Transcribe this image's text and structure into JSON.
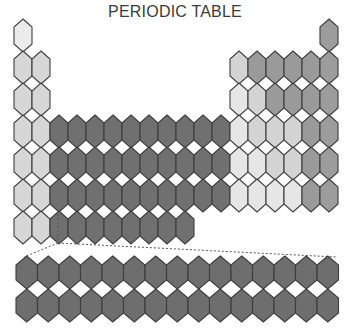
{
  "title": "PERIODIC TABLE",
  "colors": {
    "s_light": "#d6d6d6",
    "h_light": "#ebebeb",
    "transition": "#707070",
    "f_block": "#6e6e6e",
    "p_lightest": "#e6e6e6",
    "p_light": "#d3d3d3",
    "p_mid": "#b3b3b3",
    "p_dark": "#9a9a9a",
    "noble": "#9c9c9c",
    "stroke": "#3d3d3d"
  },
  "grid": {
    "origin_x": 14,
    "origin_y": 19,
    "cell_w": 18,
    "cell_h": 32,
    "cut": 8
  },
  "main_table": [
    {
      "row": 1,
      "cells": [
        {
          "col": 1,
          "shade": "h_light"
        },
        {
          "col": 18,
          "shade": "noble"
        }
      ]
    },
    {
      "row": 2,
      "cells": [
        {
          "col": 1,
          "shade": "s_light"
        },
        {
          "col": 2,
          "shade": "s_light"
        },
        {
          "col": 13,
          "shade": "p_light"
        },
        {
          "col": 14,
          "shade": "p_dark"
        },
        {
          "col": 15,
          "shade": "p_dark"
        },
        {
          "col": 16,
          "shade": "p_dark"
        },
        {
          "col": 17,
          "shade": "p_dark"
        },
        {
          "col": 18,
          "shade": "noble"
        }
      ]
    },
    {
      "row": 3,
      "cells": [
        {
          "col": 1,
          "shade": "s_light"
        },
        {
          "col": 2,
          "shade": "s_light"
        },
        {
          "col": 13,
          "shade": "p_lightest"
        },
        {
          "col": 14,
          "shade": "p_light"
        },
        {
          "col": 15,
          "shade": "p_dark"
        },
        {
          "col": 16,
          "shade": "p_dark"
        },
        {
          "col": 17,
          "shade": "p_dark"
        },
        {
          "col": 18,
          "shade": "noble"
        }
      ]
    },
    {
      "row": 4,
      "cells": [
        {
          "col": 1,
          "shade": "s_light"
        },
        {
          "col": 2,
          "shade": "s_light"
        },
        {
          "col": 3,
          "shade": "transition"
        },
        {
          "col": 4,
          "shade": "transition"
        },
        {
          "col": 5,
          "shade": "transition"
        },
        {
          "col": 6,
          "shade": "transition"
        },
        {
          "col": 7,
          "shade": "transition"
        },
        {
          "col": 8,
          "shade": "transition"
        },
        {
          "col": 9,
          "shade": "transition"
        },
        {
          "col": 10,
          "shade": "transition"
        },
        {
          "col": 11,
          "shade": "transition"
        },
        {
          "col": 12,
          "shade": "transition"
        },
        {
          "col": 13,
          "shade": "p_lightest"
        },
        {
          "col": 14,
          "shade": "p_light"
        },
        {
          "col": 15,
          "shade": "p_light"
        },
        {
          "col": 16,
          "shade": "p_light"
        },
        {
          "col": 17,
          "shade": "p_dark"
        },
        {
          "col": 18,
          "shade": "noble"
        }
      ]
    },
    {
      "row": 5,
      "cells": [
        {
          "col": 1,
          "shade": "s_light"
        },
        {
          "col": 2,
          "shade": "s_light"
        },
        {
          "col": 3,
          "shade": "transition"
        },
        {
          "col": 4,
          "shade": "transition"
        },
        {
          "col": 5,
          "shade": "transition"
        },
        {
          "col": 6,
          "shade": "transition"
        },
        {
          "col": 7,
          "shade": "transition"
        },
        {
          "col": 8,
          "shade": "transition"
        },
        {
          "col": 9,
          "shade": "transition"
        },
        {
          "col": 10,
          "shade": "transition"
        },
        {
          "col": 11,
          "shade": "transition"
        },
        {
          "col": 12,
          "shade": "transition"
        },
        {
          "col": 13,
          "shade": "p_lightest"
        },
        {
          "col": 14,
          "shade": "p_lightest"
        },
        {
          "col": 15,
          "shade": "p_light"
        },
        {
          "col": 16,
          "shade": "p_light"
        },
        {
          "col": 17,
          "shade": "p_dark"
        },
        {
          "col": 18,
          "shade": "noble"
        }
      ]
    },
    {
      "row": 6,
      "cells": [
        {
          "col": 1,
          "shade": "s_light"
        },
        {
          "col": 2,
          "shade": "s_light"
        },
        {
          "col": 3,
          "shade": "transition"
        },
        {
          "col": 4,
          "shade": "transition"
        },
        {
          "col": 5,
          "shade": "transition"
        },
        {
          "col": 6,
          "shade": "transition"
        },
        {
          "col": 7,
          "shade": "transition"
        },
        {
          "col": 8,
          "shade": "transition"
        },
        {
          "col": 9,
          "shade": "transition"
        },
        {
          "col": 10,
          "shade": "transition"
        },
        {
          "col": 11,
          "shade": "transition"
        },
        {
          "col": 12,
          "shade": "transition"
        },
        {
          "col": 13,
          "shade": "p_lightest"
        },
        {
          "col": 14,
          "shade": "p_lightest"
        },
        {
          "col": 15,
          "shade": "p_lightest"
        },
        {
          "col": 16,
          "shade": "p_lightest"
        },
        {
          "col": 17,
          "shade": "p_dark"
        },
        {
          "col": 18,
          "shade": "noble"
        }
      ]
    },
    {
      "row": 7,
      "cells": [
        {
          "col": 1,
          "shade": "s_light"
        },
        {
          "col": 2,
          "shade": "s_light"
        },
        {
          "col": 3,
          "shade": "transition"
        },
        {
          "col": 4,
          "shade": "transition"
        },
        {
          "col": 5,
          "shade": "transition"
        },
        {
          "col": 6,
          "shade": "transition"
        },
        {
          "col": 7,
          "shade": "transition"
        },
        {
          "col": 8,
          "shade": "transition"
        },
        {
          "col": 9,
          "shade": "transition"
        },
        {
          "col": 10,
          "shade": "transition"
        }
      ]
    }
  ],
  "f_block": {
    "origin_x": 16,
    "origin_y": 256,
    "cell_w": 21.5,
    "cell_h": 33,
    "cut": 9,
    "rows": [
      {
        "name": "lanthanides",
        "count": 15,
        "shade": "f_block"
      },
      {
        "name": "actinides",
        "count": 15,
        "shade": "f_block"
      }
    ]
  },
  "connector": {
    "from": [
      58,
      243
    ],
    "left_to": [
      24,
      257
    ],
    "right_to": [
      336,
      257
    ],
    "stub_top": [
      58,
      214
    ]
  }
}
